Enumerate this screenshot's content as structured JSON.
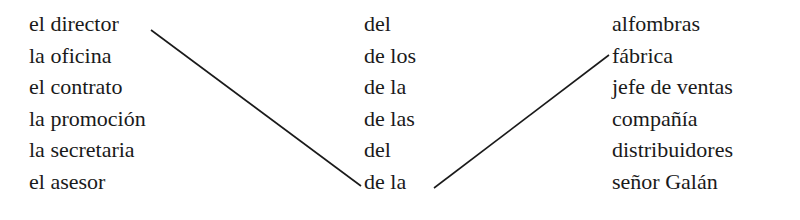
{
  "columns": {
    "a": [
      "el director",
      "la oficina",
      "el contrato",
      "la promoción",
      "la secretaria",
      "el asesor"
    ],
    "b": [
      "del",
      "de los",
      "de la",
      "de las",
      "del",
      "de la"
    ],
    "c": [
      "alfombras",
      "fábrica",
      "jefe de ventas",
      "compañía",
      "distribuidores",
      "señor Galán"
    ]
  },
  "connections": [
    {
      "from": "el director",
      "to": "de la"
    },
    {
      "from": "de la",
      "to": "fábrica"
    }
  ],
  "line_color": "#1a1a1a"
}
